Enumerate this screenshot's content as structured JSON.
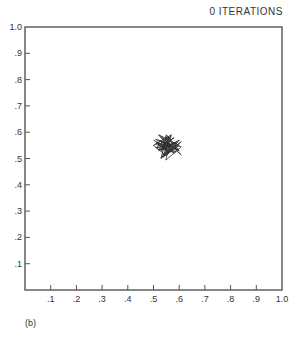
{
  "chart_data": {
    "type": "line",
    "title": "0 ITERATIONS",
    "caption": "(b)",
    "xlabel": "",
    "ylabel": "",
    "xlim": [
      0,
      1.0
    ],
    "ylim": [
      0,
      1.0
    ],
    "grid": false,
    "x_ticks": [
      ".1",
      ".2",
      ".3",
      ".4",
      ".5",
      ".6",
      ".7",
      ".8",
      ".9",
      "1.0"
    ],
    "y_ticks": [
      ".1",
      ".2",
      ".3",
      ".4",
      ".5",
      ".6",
      ".7",
      ".8",
      ".9",
      "1.0"
    ],
    "series": [
      {
        "name": "random path (tangled cluster)",
        "x": [
          0.5,
          0.58,
          0.52,
          0.6,
          0.54,
          0.56,
          0.51,
          0.59,
          0.53,
          0.57,
          0.5,
          0.55,
          0.6,
          0.52,
          0.58,
          0.54,
          0.56,
          0.51,
          0.59,
          0.55,
          0.53,
          0.57,
          0.52,
          0.6,
          0.54
        ],
        "y": [
          0.57,
          0.52,
          0.59,
          0.55,
          0.51,
          0.58,
          0.54,
          0.56,
          0.53,
          0.59,
          0.55,
          0.51,
          0.57,
          0.53,
          0.58,
          0.55,
          0.52,
          0.56,
          0.54,
          0.59,
          0.5,
          0.55,
          0.57,
          0.53,
          0.56
        ]
      }
    ],
    "cluster_center": [
      0.55,
      0.55
    ]
  }
}
